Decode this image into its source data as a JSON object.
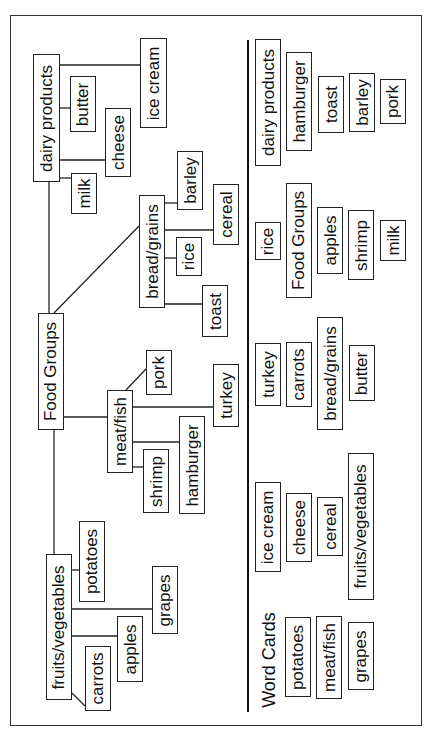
{
  "diagram": {
    "type": "tree",
    "orientation": "rotated -90deg (text reads bottom-to-top)",
    "root": "Food Groups",
    "branches": [
      {
        "label": "dairy products",
        "children": [
          "milk",
          "butter",
          "cheese",
          "ice cream"
        ]
      },
      {
        "label": "bread/grains",
        "children": [
          "barley",
          "cereal",
          "rice",
          "toast"
        ]
      },
      {
        "label": "meat/fish",
        "children": [
          "pork",
          "turkey",
          "shrimp",
          "hamburger"
        ]
      },
      {
        "label": "fruits/vegetables",
        "children": [
          "potatoes",
          "grapes",
          "apples",
          "carrots"
        ]
      }
    ]
  },
  "tree_nodes": {
    "dairy_products": "dairy products",
    "butter": "butter",
    "cheese": "cheese",
    "ice_cream": "ice cream",
    "milk": "milk",
    "bread_grains": "bread/grains",
    "barley": "barley",
    "cereal": "cereal",
    "rice": "rice",
    "toast": "toast",
    "food_groups": "Food Groups",
    "meat_fish": "meat/fish",
    "pork": "pork",
    "turkey": "turkey",
    "shrimp": "shrimp",
    "hamburger": "hamburger",
    "fruits_vegetables": "fruits/vegetables",
    "potatoes": "potatoes",
    "grapes": "grapes",
    "apples": "apples",
    "carrots": "carrots"
  },
  "word_cards": {
    "title": "Word Cards",
    "cards": [
      "dairy products",
      "hamburger",
      "toast",
      "barley",
      "pork",
      "rice",
      "Food Groups",
      "apples",
      "shrimp",
      "milk",
      "turkey",
      "carrots",
      "bread/grains",
      "butter",
      "ice cream",
      "cheese",
      "cereal",
      "fruits/vegetables",
      "potatoes",
      "meat/fish",
      "grapes"
    ]
  }
}
